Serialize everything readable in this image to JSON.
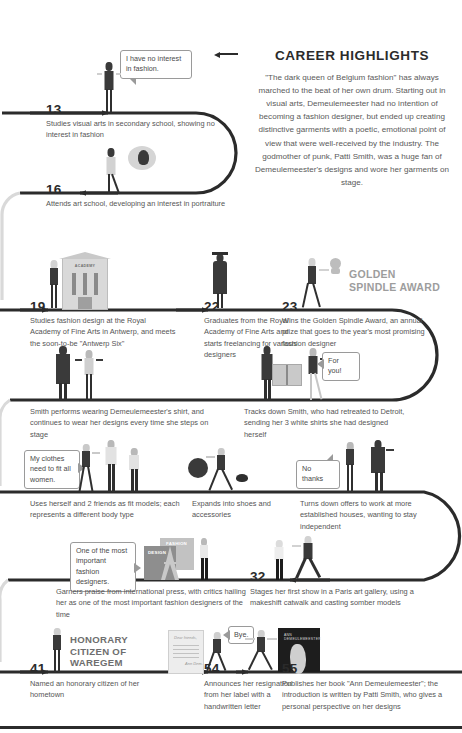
{
  "header": {
    "title": "CAREER HIGHLIGHTS",
    "lead": "\"The dark queen of Belgium fashion\" has always marched to the beat of her own drum. Starting out in visual arts, Demeulemeester had no intention of becoming a fashion designer, but ended up creating distinctive garments with a poetic, emotional point of view that were well-received by the industry. The godmother of punk, Patti Smith, was a huge fan of Demeulemeester's designs and wore her garments on stage.",
    "rule_left_icon": "arrow-left-icon",
    "rule_right_icon": "arrow-right-icon"
  },
  "colors": {
    "timeline": "#2b2b2b",
    "text": "#555555",
    "age": "#2b2b2b",
    "award_label": "#9d9d9d",
    "bubble_border": "#9a9a9a",
    "background": "#ffffff"
  },
  "events": [
    {
      "age": "13",
      "desc": "Studies visual arts in secondary school, showing no interest in fashion",
      "bubble": "I have no interest in fashion."
    },
    {
      "age": "16",
      "desc": "Attends art school, developing an interest in portraiture",
      "bubble": null
    },
    {
      "age": "19",
      "desc": "Studies fashion design at the Royal Academy of Fine Arts in Antwerp, and meets the soon-to-be \"Antwerp Six\"",
      "prop_label": "ACADEMY"
    },
    {
      "age": "22",
      "desc": "Graduates from the Royal Academy of Fine Arts and starts freelancing for various designers"
    },
    {
      "age": "23",
      "desc": "Wins the Golden Spindle Award, an annual prize that goes to the year's most promising fashion designer",
      "award_label": "GOLDEN\nSPINDLE AWARD"
    },
    {
      "age": "",
      "desc": "Smith performs wearing Demeulemeester's shirt, and continues to wear her designs every time she steps on stage"
    },
    {
      "age": "",
      "desc": "Tracks down Smith, who had retreated to Detroit, sending her 3 white shirts she had designed herself",
      "bubble": "For you!"
    },
    {
      "age": "",
      "desc": "Uses herself and 2 friends as fit models;  each represents a different body type",
      "bubble": "My clothes need to fit all women."
    },
    {
      "age": "",
      "desc": "Expands into shoes and accessories"
    },
    {
      "age": "",
      "desc": "Turns down offers to work at more established houses, wanting to stay independent",
      "bubble": "No thanks"
    },
    {
      "age": "",
      "desc": "Garners praise from international press, with critics hailing her as one of the most important fashion designers of the time",
      "bubble": "One of the most important fashion designers.",
      "prop_labels": [
        "FASHION",
        "DESIGN"
      ]
    },
    {
      "age": "32",
      "desc": "Stages her first show in a Paris art gallery, using a makeshift catwalk and casting somber models"
    },
    {
      "age": "41",
      "desc": "Named an honorary citizen of her hometown",
      "award_label": "HONORARY\nCITIZEN OF\nWAREGEM"
    },
    {
      "age": "54",
      "desc": "Announces her resignation from her label with a handwritten letter",
      "bubble": "Bye.",
      "letter_salutation": "Dear friends,",
      "letter_signature": "Ann Dem."
    },
    {
      "age": "55",
      "desc": "Publishes her book \"Ann Demeulemeester\"; the introduction is written by Patti Smith, who gives a personal perspective on her designs",
      "book_title": "ANN DEMEULEMEESTER"
    }
  ]
}
